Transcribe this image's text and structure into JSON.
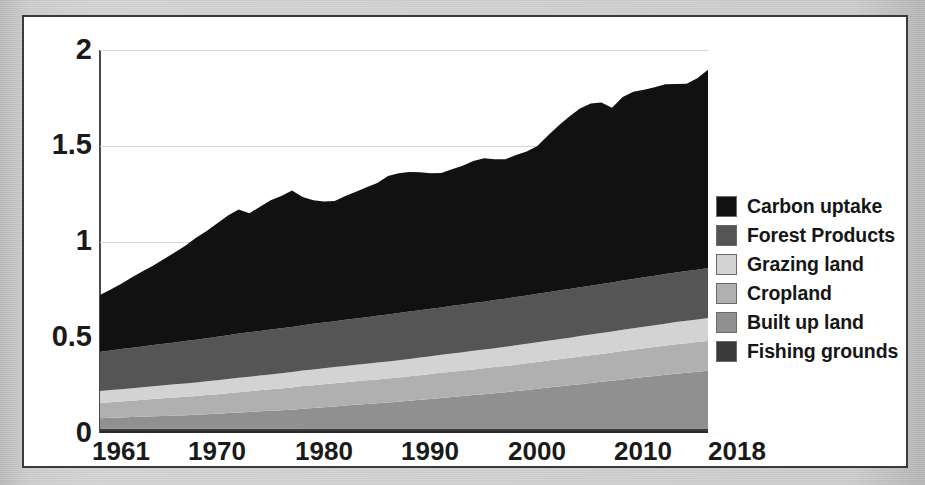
{
  "figure": {
    "background_color": "#ffffff",
    "frame_color": "#3b3b3b",
    "page_color": "#cccccc"
  },
  "legend": {
    "position": "right",
    "items": [
      {
        "label": "Carbon uptake",
        "color": "#111111",
        "key": "carbon_uptake"
      },
      {
        "label": "Forest Products",
        "color": "#555555",
        "key": "forest_products"
      },
      {
        "label": "Grazing land",
        "color": "#d3d3d3",
        "key": "grazing_land"
      },
      {
        "label": "Cropland",
        "color": "#b0b0b0",
        "key": "cropland"
      },
      {
        "label": "Built up land",
        "color": "#909090",
        "key": "built_up_land"
      },
      {
        "label": "Fishing grounds",
        "color": "#3a3a3a",
        "key": "fishing_grounds"
      }
    ]
  },
  "axes": {
    "y_ticks": [
      "0",
      "0.5",
      "1",
      "1.5",
      "2"
    ],
    "x_ticks": [
      "1961",
      "1970",
      "1980",
      "1990",
      "2000",
      "2010",
      "2018"
    ],
    "ylim": [
      0,
      2
    ],
    "xlim": [
      1961,
      2018
    ],
    "grid": true,
    "ylabel": "",
    "xlabel": ""
  },
  "chart_data": {
    "type": "area",
    "stacked": true,
    "title": "",
    "subtitle": "",
    "xlabel": "",
    "ylabel": "",
    "ylim": [
      0,
      2
    ],
    "grid": true,
    "legend_position": "right",
    "x": [
      1961,
      1962,
      1963,
      1964,
      1965,
      1966,
      1967,
      1968,
      1969,
      1970,
      1971,
      1972,
      1973,
      1974,
      1975,
      1976,
      1977,
      1978,
      1979,
      1980,
      1981,
      1982,
      1983,
      1984,
      1985,
      1986,
      1987,
      1988,
      1989,
      1990,
      1991,
      1992,
      1993,
      1994,
      1995,
      1996,
      1997,
      1998,
      1999,
      2000,
      2001,
      2002,
      2003,
      2004,
      2005,
      2006,
      2007,
      2008,
      2009,
      2010,
      2011,
      2012,
      2013,
      2014,
      2015,
      2016,
      2017,
      2018
    ],
    "x_tick_labels": [
      "1961",
      "1970",
      "1980",
      "1990",
      "2000",
      "2010",
      "2018"
    ],
    "stack_order_bottom_to_top": [
      "fishing_grounds",
      "built_up_land",
      "cropland",
      "grazing_land",
      "forest_products",
      "carbon_uptake"
    ],
    "series": [
      {
        "name": "Fishing grounds",
        "key": "fishing_grounds",
        "color": "#3a3a3a",
        "values": [
          0.022,
          0.022,
          0.022,
          0.022,
          0.022,
          0.022,
          0.022,
          0.022,
          0.022,
          0.022,
          0.022,
          0.022,
          0.022,
          0.022,
          0.022,
          0.022,
          0.022,
          0.022,
          0.022,
          0.023,
          0.023,
          0.023,
          0.023,
          0.023,
          0.023,
          0.023,
          0.023,
          0.023,
          0.023,
          0.023,
          0.023,
          0.023,
          0.023,
          0.023,
          0.023,
          0.023,
          0.023,
          0.023,
          0.023,
          0.023,
          0.023,
          0.023,
          0.023,
          0.023,
          0.023,
          0.023,
          0.023,
          0.023,
          0.023,
          0.023,
          0.023,
          0.023,
          0.023,
          0.023,
          0.023,
          0.023,
          0.023,
          0.023
        ]
      },
      {
        "name": "Built up land",
        "key": "built_up_land",
        "color": "#909090",
        "values": [
          0.055,
          0.057,
          0.059,
          0.061,
          0.063,
          0.065,
          0.067,
          0.069,
          0.071,
          0.073,
          0.076,
          0.079,
          0.082,
          0.085,
          0.088,
          0.091,
          0.094,
          0.097,
          0.1,
          0.104,
          0.108,
          0.112,
          0.116,
          0.12,
          0.124,
          0.128,
          0.132,
          0.136,
          0.14,
          0.145,
          0.15,
          0.155,
          0.16,
          0.165,
          0.17,
          0.175,
          0.18,
          0.185,
          0.19,
          0.196,
          0.202,
          0.208,
          0.214,
          0.22,
          0.226,
          0.232,
          0.238,
          0.244,
          0.25,
          0.257,
          0.263,
          0.269,
          0.275,
          0.281,
          0.287,
          0.292,
          0.297,
          0.302
        ]
      },
      {
        "name": "Cropland",
        "key": "cropland",
        "color": "#b0b0b0",
        "values": [
          0.08,
          0.082,
          0.084,
          0.086,
          0.088,
          0.09,
          0.092,
          0.094,
          0.096,
          0.098,
          0.1,
          0.102,
          0.104,
          0.106,
          0.108,
          0.11,
          0.112,
          0.114,
          0.116,
          0.118,
          0.119,
          0.12,
          0.121,
          0.122,
          0.123,
          0.124,
          0.125,
          0.126,
          0.127,
          0.128,
          0.129,
          0.13,
          0.131,
          0.132,
          0.133,
          0.134,
          0.135,
          0.136,
          0.137,
          0.138,
          0.139,
          0.14,
          0.141,
          0.142,
          0.143,
          0.144,
          0.145,
          0.146,
          0.147,
          0.148,
          0.149,
          0.15,
          0.151,
          0.152,
          0.153,
          0.154,
          0.155,
          0.156
        ]
      },
      {
        "name": "Grazing land",
        "key": "grazing_land",
        "color": "#d3d3d3",
        "values": [
          0.062,
          0.063,
          0.064,
          0.065,
          0.066,
          0.067,
          0.068,
          0.069,
          0.07,
          0.071,
          0.072,
          0.073,
          0.074,
          0.075,
          0.076,
          0.077,
          0.078,
          0.079,
          0.08,
          0.081,
          0.082,
          0.083,
          0.084,
          0.085,
          0.086,
          0.087,
          0.088,
          0.089,
          0.09,
          0.091,
          0.092,
          0.093,
          0.094,
          0.095,
          0.096,
          0.097,
          0.098,
          0.099,
          0.1,
          0.101,
          0.102,
          0.103,
          0.104,
          0.105,
          0.106,
          0.107,
          0.108,
          0.109,
          0.11,
          0.111,
          0.112,
          0.113,
          0.114,
          0.115,
          0.116,
          0.117,
          0.118,
          0.119
        ]
      },
      {
        "name": "Forest Products",
        "key": "forest_products",
        "color": "#555555",
        "values": [
          0.205,
          0.207,
          0.209,
          0.211,
          0.213,
          0.215,
          0.217,
          0.219,
          0.221,
          0.223,
          0.225,
          0.227,
          0.229,
          0.231,
          0.232,
          0.233,
          0.234,
          0.235,
          0.236,
          0.237,
          0.238,
          0.239,
          0.24,
          0.241,
          0.242,
          0.243,
          0.244,
          0.245,
          0.246,
          0.247,
          0.247,
          0.248,
          0.248,
          0.249,
          0.249,
          0.25,
          0.25,
          0.251,
          0.251,
          0.252,
          0.252,
          0.253,
          0.253,
          0.254,
          0.254,
          0.255,
          0.255,
          0.256,
          0.256,
          0.257,
          0.257,
          0.258,
          0.258,
          0.259,
          0.259,
          0.26,
          0.26,
          0.261
        ]
      },
      {
        "name": "Carbon uptake",
        "key": "carbon_uptake",
        "color": "#111111",
        "values": [
          0.296,
          0.319,
          0.341,
          0.368,
          0.392,
          0.416,
          0.442,
          0.47,
          0.498,
          0.533,
          0.56,
          0.592,
          0.625,
          0.648,
          0.621,
          0.648,
          0.676,
          0.691,
          0.712,
          0.67,
          0.645,
          0.632,
          0.628,
          0.647,
          0.662,
          0.678,
          0.694,
          0.723,
          0.731,
          0.729,
          0.72,
          0.708,
          0.702,
          0.713,
          0.724,
          0.741,
          0.749,
          0.735,
          0.728,
          0.742,
          0.752,
          0.772,
          0.818,
          0.862,
          0.901,
          0.933,
          0.952,
          0.948,
          0.912,
          0.958,
          0.978,
          0.979,
          0.984,
          0.991,
          0.985,
          0.978,
          1.0,
          1.036
        ]
      }
    ],
    "totals": [
      0.72,
      0.75,
      0.779,
      0.813,
      0.844,
      0.875,
      0.908,
      0.943,
      0.978,
      1.02,
      1.055,
      1.095,
      1.136,
      1.167,
      1.148,
      1.182,
      1.216,
      1.239,
      1.267,
      1.233,
      1.215,
      1.209,
      1.212,
      1.238,
      1.26,
      1.283,
      1.306,
      1.342,
      1.357,
      1.363,
      1.361,
      1.357,
      1.358,
      1.377,
      1.395,
      1.42,
      1.435,
      1.429,
      1.429,
      1.452,
      1.47,
      1.499,
      1.553,
      1.606,
      1.653,
      1.694,
      1.721,
      1.726,
      1.698,
      1.754,
      1.782,
      1.792,
      1.805,
      1.821,
      1.823,
      1.824,
      1.853,
      1.897
    ]
  }
}
